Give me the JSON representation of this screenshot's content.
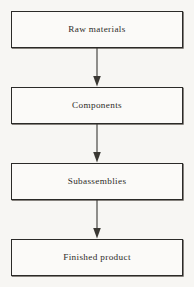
{
  "diagram": {
    "type": "vertical-flowchart",
    "background_color": "#f7f6f3",
    "border_color": "#2b2a28",
    "text_color": "#2e2c29",
    "arrow_color": "#3a3833",
    "stages": [
      {
        "id": "raw-materials",
        "label": "Raw materials"
      },
      {
        "id": "components",
        "label": "Components"
      },
      {
        "id": "subassemblies",
        "label": "Subassemblies"
      },
      {
        "id": "finished-product",
        "label": "Finished product"
      }
    ],
    "connectors": [
      {
        "from": "raw-materials",
        "to": "components",
        "icon": "down-arrow-icon"
      },
      {
        "from": "components",
        "to": "subassemblies",
        "icon": "down-arrow-icon"
      },
      {
        "from": "subassemblies",
        "to": "finished-product",
        "icon": "down-arrow-icon"
      }
    ]
  }
}
